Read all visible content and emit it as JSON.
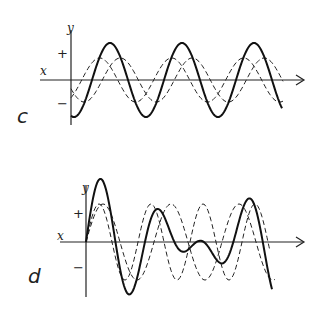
{
  "panels": [
    {
      "id": "c",
      "label": "c",
      "x_axis_label": "x",
      "y_axis_label": "y",
      "plus_label": "+",
      "minus_label": "−",
      "description": "Two dashed component waves of equal frequency, phase-shifted, sum to a larger solid wave of the same frequency (constructive interference)"
    },
    {
      "id": "d",
      "label": "d",
      "x_axis_label": "x",
      "y_axis_label": "y",
      "plus_label": "+",
      "minus_label": "−",
      "description": "Two dashed component waves of different frequencies sum to a complex solid wave with beats"
    }
  ],
  "chart_data": [
    {
      "type": "line",
      "title": "c",
      "xlabel": "x",
      "ylabel": "y",
      "series": [
        {
          "name": "component 1 (dashed)",
          "style": "dashed",
          "amplitude": 1.0,
          "cycles": 3,
          "phase": "leading"
        },
        {
          "name": "component 2 (dashed)",
          "style": "dashed",
          "amplitude": 1.0,
          "cycles": 3,
          "phase": "lagging"
        },
        {
          "name": "resultant (solid)",
          "style": "solid",
          "amplitude": 1.7,
          "cycles": 3,
          "phase": "between"
        }
      ]
    },
    {
      "type": "line",
      "title": "d",
      "xlabel": "x",
      "ylabel": "y",
      "series": [
        {
          "name": "component 1 (dashed, higher freq)",
          "style": "dashed",
          "amplitude": 1.0,
          "cycles": 4
        },
        {
          "name": "component 2 (dashed, lower freq)",
          "style": "dashed",
          "amplitude": 1.0,
          "cycles": 3
        },
        {
          "name": "resultant (solid)",
          "style": "solid",
          "amplitude": "varies, max ~2"
        }
      ]
    }
  ]
}
